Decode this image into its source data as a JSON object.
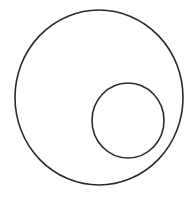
{
  "diagram": {
    "type": "nested-circles",
    "background": "#ffffff",
    "stroke_color": "#2a2a2a",
    "stroke_width": 1.6,
    "shapes": [
      {
        "name": "outer-circle",
        "cx": 99,
        "cy": 97.5,
        "rx": 84,
        "ry": 87.5
      },
      {
        "name": "inner-circle",
        "cx": 128,
        "cy": 120.5,
        "rx": 36,
        "ry": 37.5
      }
    ]
  }
}
